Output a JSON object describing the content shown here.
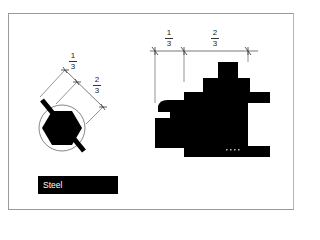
{
  "diagram": {
    "left_figure": {
      "name": "hexagon-in-circle-with-diagonal-bar",
      "dimensions": [
        {
          "numerator": "1",
          "denominator": "3"
        },
        {
          "numerator": "2",
          "denominator": "3"
        }
      ]
    },
    "right_figure": {
      "name": "stepped-profile",
      "dimensions": [
        {
          "numerator": "1",
          "denominator": "3"
        },
        {
          "numerator": "2",
          "denominator": "3"
        }
      ]
    },
    "material_label": "Steel",
    "colors": {
      "fill": "#000000",
      "line": "#555555",
      "frame": "#9a9a9a",
      "background": "#ffffff",
      "label_text": "#ffffff"
    }
  }
}
